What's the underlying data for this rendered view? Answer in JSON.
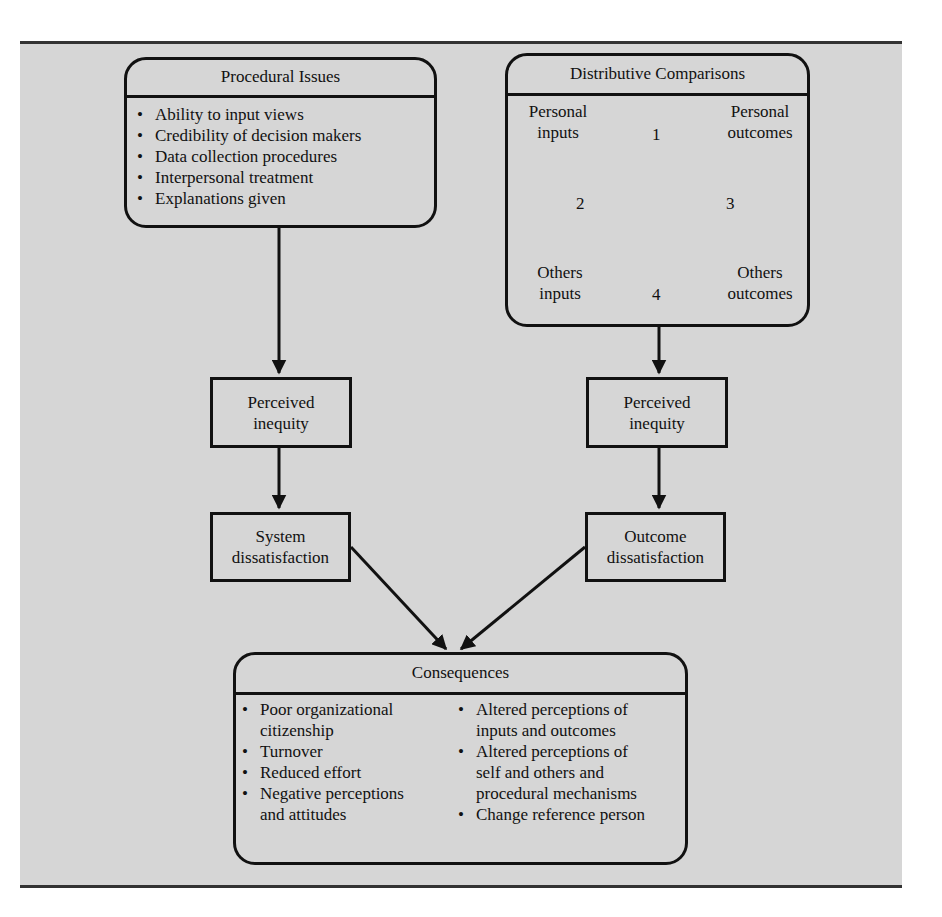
{
  "procedural": {
    "title": "Procedural Issues",
    "items": [
      "Ability to input views",
      "Credibility of decision makers",
      "Data collection procedures",
      "Interpersonal treatment",
      "Explanations given"
    ]
  },
  "distributive": {
    "title": "Distributive Comparisons",
    "nodes": {
      "personal_inputs": [
        "Personal",
        "inputs"
      ],
      "personal_outcomes": [
        "Personal",
        "outcomes"
      ],
      "others_inputs": [
        "Others",
        "inputs"
      ],
      "others_outcomes": [
        "Others",
        "outcomes"
      ]
    },
    "comparisons": [
      "1",
      "2",
      "3",
      "4"
    ]
  },
  "left_chain": {
    "perceived": [
      "Perceived",
      "inequity"
    ],
    "dissatisfaction": [
      "System",
      "dissatisfaction"
    ]
  },
  "right_chain": {
    "perceived": [
      "Perceived",
      "inequity"
    ],
    "dissatisfaction": [
      "Outcome",
      "dissatisfaction"
    ]
  },
  "consequences": {
    "title": "Consequences",
    "left_items": [
      [
        "Poor organizational",
        "citizenship"
      ],
      [
        "Turnover"
      ],
      [
        "Reduced effort"
      ],
      [
        "Negative perceptions",
        "and attitudes"
      ]
    ],
    "right_items": [
      [
        "Altered perceptions of",
        "inputs and outcomes"
      ],
      [
        "Altered perceptions of",
        "self and others and",
        "procedural mechanisms"
      ],
      [
        "Change reference person"
      ]
    ]
  },
  "colors": {
    "panel_bg": "#d6d6d6",
    "stroke": "#111111",
    "page_bg": "#ffffff"
  }
}
